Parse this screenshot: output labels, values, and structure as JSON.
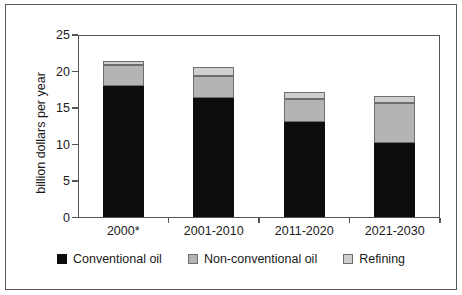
{
  "chart_data": {
    "type": "bar",
    "stacked": true,
    "title": "",
    "xlabel": "",
    "ylabel": "billion dollars per year",
    "ylim": [
      0,
      25
    ],
    "yticks": [
      0,
      5,
      10,
      15,
      20,
      25
    ],
    "ytick_labels": [
      "0",
      "5",
      "10",
      "15",
      "20",
      "25"
    ],
    "grid": false,
    "legend_position": "bottom",
    "categories": [
      "2000*",
      "2001-2010",
      "2011-2020",
      "2021-2030"
    ],
    "series": [
      {
        "name": "Conventional oil",
        "color": "#0d0d0d",
        "values": [
          18.0,
          16.4,
          13.1,
          10.2
        ]
      },
      {
        "name": "Non-conventional oil",
        "color": "#b4b4b4",
        "values": [
          2.9,
          3.0,
          3.2,
          5.5
        ]
      },
      {
        "name": "Refining",
        "color": "#cfcfcf",
        "values": [
          0.6,
          1.2,
          0.9,
          0.9
        ]
      }
    ],
    "totals": [
      21.5,
      20.6,
      17.2,
      16.6
    ]
  },
  "legend": {
    "items": [
      {
        "label": "Conventional oil",
        "swatch": "conv"
      },
      {
        "label": "Non-conventional oil",
        "swatch": "noncon"
      },
      {
        "label": "Refining",
        "swatch": "refin"
      }
    ]
  }
}
